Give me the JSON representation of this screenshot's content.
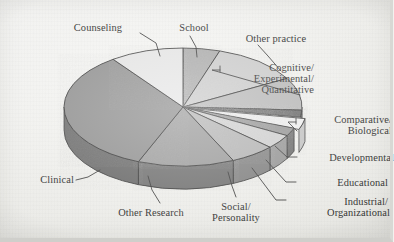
{
  "chart_data": {
    "type": "pie",
    "title": "",
    "subtitle": "",
    "xlabel": "",
    "ylabel": "",
    "legend_position": "none",
    "grid": false,
    "style": "3d-pie",
    "note": "Values are percentages estimated from slice arc angles; labels placed around the pie with leader lines.",
    "categories": [
      "Clinical",
      "Counseling",
      "School",
      "Other practice",
      "Cognitive/\nExperimental/\nQuantitative",
      "Comparative/\nBiological",
      "Developmental",
      "Educational",
      "Industrial/\nOrganizational",
      "Social/\nPersonality",
      "Other Research"
    ],
    "values": [
      34,
      10,
      5,
      12,
      9,
      2,
      3,
      2,
      4,
      6,
      13
    ],
    "slices": [
      {
        "label": "School",
        "start_deg": 0,
        "end_deg": 18,
        "percent": 5,
        "color": "#a6a6a6",
        "side_color": "#6f6f6f"
      },
      {
        "label": "Other practice",
        "start_deg": 18,
        "end_deg": 61,
        "percent": 12,
        "color": "#c9c9c9",
        "side_color": "#8b8b8b"
      },
      {
        "label": "Cognitive/ Experimental/ Quantitative",
        "start_deg": 61,
        "end_deg": 93,
        "percent": 9,
        "color": "#b5b5b5",
        "side_color": "#7d7d7d"
      },
      {
        "label": "Comparative/ Biological",
        "start_deg": 93,
        "end_deg": 100,
        "percent": 2,
        "color": "#5a5a5a",
        "side_color": "#3f3f3f"
      },
      {
        "label": "Developmental",
        "start_deg": 100,
        "end_deg": 111,
        "percent": 3,
        "color": "#f2f2f2",
        "side_color": "#c2c2c2"
      },
      {
        "label": "Educational",
        "start_deg": 111,
        "end_deg": 119,
        "percent": 2,
        "color": "#8f8f8f",
        "side_color": "#636363"
      },
      {
        "label": "Industrial/ Organizational",
        "start_deg": 119,
        "end_deg": 133,
        "percent": 4,
        "color": "#cfcfcf",
        "side_color": "#909090"
      },
      {
        "label": "Social/ Personality",
        "start_deg": 133,
        "end_deg": 155,
        "percent": 6,
        "color": "#b0b0b0",
        "side_color": "#797979"
      },
      {
        "label": "Other Research",
        "start_deg": 155,
        "end_deg": 202,
        "percent": 13,
        "color": "#969696",
        "side_color": "#676767"
      },
      {
        "label": "Clinical",
        "start_deg": 202,
        "end_deg": 324,
        "percent": 34,
        "color": "#8a8a8a",
        "side_color": "#5e5e5e"
      },
      {
        "label": "Counseling",
        "start_deg": 324,
        "end_deg": 360,
        "percent": 10,
        "color": "#e6e6e6",
        "side_color": "#b0b0b0"
      }
    ]
  },
  "labels": {
    "counseling": "Counseling",
    "school": "School",
    "other_practice": "Other practice",
    "cognitive_1": "Cognitive/",
    "cognitive_2": "Experimental/",
    "cognitive_3": "Quantitative",
    "comparative_1": "Comparative/",
    "comparative_2": "Biological",
    "developmental": "Developmental",
    "educational": "Educational",
    "industrial_1": "Industrial/",
    "industrial_2": "Organizational",
    "social_1": "Social/",
    "social_2": "Personality",
    "other_research": "Other Research",
    "clinical": "Clinical"
  },
  "colors": {
    "background": "#f2f2ef",
    "outline": "#1f1f1f",
    "text": "#1a1a1a",
    "leader_line": "#2a2a2a"
  }
}
